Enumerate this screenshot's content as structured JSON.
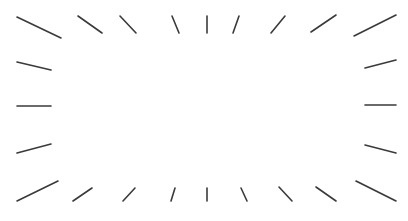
{
  "figure": {
    "width": 408,
    "height": 221,
    "background": "#ffffff",
    "stroke_color": "#3a3a3a",
    "stroke_width": 1.6,
    "shape": "radial burst frame of line segments around an empty rectangular center"
  },
  "rays": [
    {
      "id": "top-1",
      "x1": 17,
      "y1": 17,
      "x2": 61,
      "y2": 38
    },
    {
      "id": "top-2",
      "x1": 78,
      "y1": 16,
      "x2": 102,
      "y2": 33
    },
    {
      "id": "top-3",
      "x1": 120,
      "y1": 16,
      "x2": 136,
      "y2": 33
    },
    {
      "id": "top-4",
      "x1": 172,
      "y1": 16,
      "x2": 179,
      "y2": 33
    },
    {
      "id": "top-5",
      "x1": 207,
      "y1": 16,
      "x2": 207,
      "y2": 33
    },
    {
      "id": "top-6",
      "x1": 239,
      "y1": 16,
      "x2": 233,
      "y2": 33
    },
    {
      "id": "top-7",
      "x1": 285,
      "y1": 16,
      "x2": 271,
      "y2": 33
    },
    {
      "id": "top-8",
      "x1": 336,
      "y1": 15,
      "x2": 311,
      "y2": 32
    },
    {
      "id": "top-9",
      "x1": 396,
      "y1": 15,
      "x2": 354,
      "y2": 36
    },
    {
      "id": "left-1",
      "x1": 17,
      "y1": 62,
      "x2": 51,
      "y2": 70
    },
    {
      "id": "left-2",
      "x1": 17,
      "y1": 106,
      "x2": 51,
      "y2": 106
    },
    {
      "id": "left-3",
      "x1": 17,
      "y1": 153,
      "x2": 51,
      "y2": 144
    },
    {
      "id": "right-1",
      "x1": 396,
      "y1": 60,
      "x2": 365,
      "y2": 68
    },
    {
      "id": "right-2",
      "x1": 396,
      "y1": 105,
      "x2": 365,
      "y2": 105
    },
    {
      "id": "right-3",
      "x1": 396,
      "y1": 153,
      "x2": 365,
      "y2": 145
    },
    {
      "id": "bottom-1",
      "x1": 17,
      "y1": 201,
      "x2": 58,
      "y2": 181
    },
    {
      "id": "bottom-2",
      "x1": 73,
      "y1": 201,
      "x2": 92,
      "y2": 188
    },
    {
      "id": "bottom-3",
      "x1": 123,
      "y1": 201,
      "x2": 135,
      "y2": 188
    },
    {
      "id": "bottom-4",
      "x1": 171,
      "y1": 201,
      "x2": 175,
      "y2": 188
    },
    {
      "id": "bottom-5",
      "x1": 207,
      "y1": 201,
      "x2": 207,
      "y2": 188
    },
    {
      "id": "bottom-6",
      "x1": 247,
      "y1": 201,
      "x2": 241,
      "y2": 188
    },
    {
      "id": "bottom-7",
      "x1": 292,
      "y1": 201,
      "x2": 279,
      "y2": 187
    },
    {
      "id": "bottom-8",
      "x1": 336,
      "y1": 201,
      "x2": 316,
      "y2": 187
    },
    {
      "id": "bottom-9",
      "x1": 396,
      "y1": 201,
      "x2": 356,
      "y2": 181
    }
  ]
}
